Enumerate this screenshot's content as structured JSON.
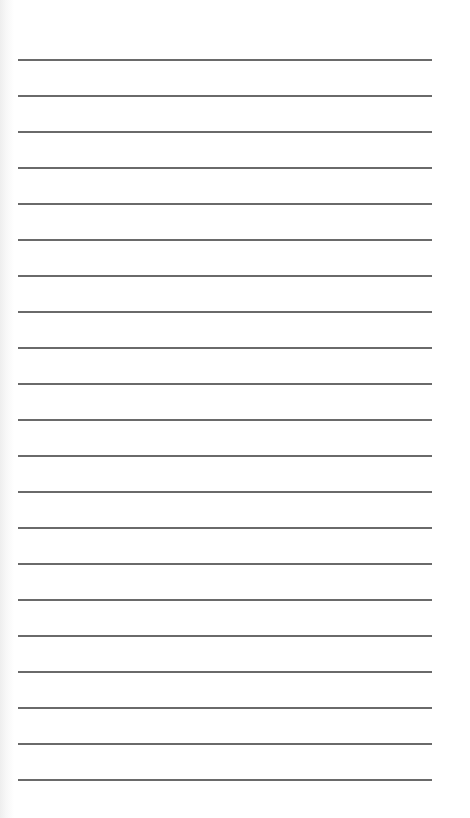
{
  "document": {
    "type": "ruled-paper",
    "line_count": 21,
    "first_line_y": 60,
    "line_spacing": 36,
    "line_left": 18,
    "line_width": 414,
    "line_color": "#5a5a5a",
    "background_color": "#ffffff",
    "lines": [
      {
        "index": 1,
        "text": ""
      },
      {
        "index": 2,
        "text": ""
      },
      {
        "index": 3,
        "text": ""
      },
      {
        "index": 4,
        "text": ""
      },
      {
        "index": 5,
        "text": ""
      },
      {
        "index": 6,
        "text": ""
      },
      {
        "index": 7,
        "text": ""
      },
      {
        "index": 8,
        "text": ""
      },
      {
        "index": 9,
        "text": ""
      },
      {
        "index": 10,
        "text": ""
      },
      {
        "index": 11,
        "text": ""
      },
      {
        "index": 12,
        "text": ""
      },
      {
        "index": 13,
        "text": ""
      },
      {
        "index": 14,
        "text": ""
      },
      {
        "index": 15,
        "text": ""
      },
      {
        "index": 16,
        "text": ""
      },
      {
        "index": 17,
        "text": ""
      },
      {
        "index": 18,
        "text": ""
      },
      {
        "index": 19,
        "text": ""
      },
      {
        "index": 20,
        "text": ""
      },
      {
        "index": 21,
        "text": ""
      }
    ]
  }
}
